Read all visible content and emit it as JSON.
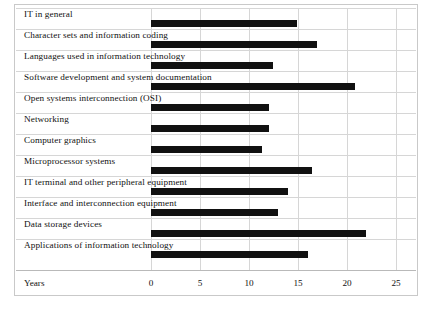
{
  "chart_data": {
    "type": "bar",
    "orientation": "horizontal",
    "title": "",
    "xlabel": "Years",
    "ylabel": "",
    "xlim": [
      0,
      25
    ],
    "xticks": [
      "0",
      "5",
      "10",
      "15",
      "20",
      "25"
    ],
    "grid": true,
    "legend": false,
    "bar_color": "#111111",
    "categories": [
      "IT in general",
      "Character sets and information coding",
      "Languages used in information technology",
      "Software development and system documentation",
      "Open systems interconnection (OSI)",
      "Networking",
      "Computer graphics",
      "Microprocessor systems",
      "IT terminal and other peripheral equipment",
      "Interface and interconnection equipment",
      "Data storage devices",
      "Applications of information technology"
    ],
    "values": [
      14.9,
      16.9,
      12.4,
      20.8,
      12.0,
      12.0,
      11.3,
      16.4,
      14.0,
      13.0,
      21.9,
      16.0
    ]
  }
}
